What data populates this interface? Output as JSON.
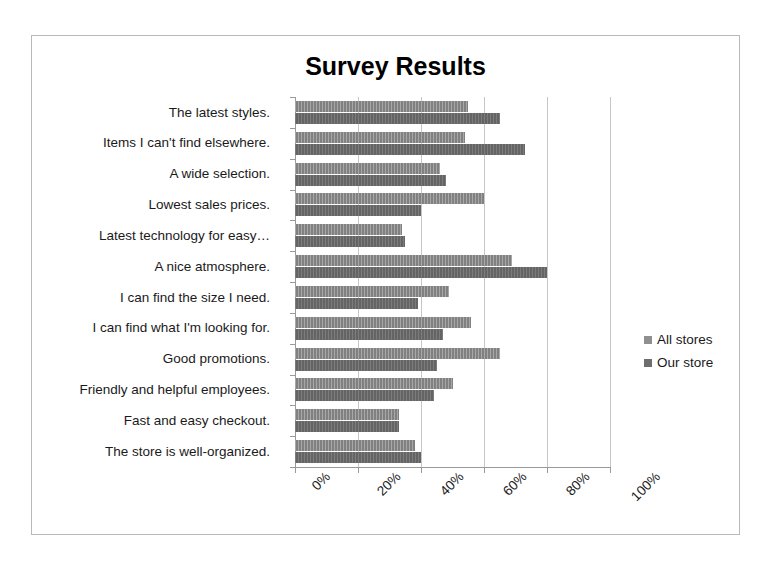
{
  "chart_data": {
    "type": "bar",
    "orientation": "horizontal",
    "title": "Survey Results",
    "xlabel": "",
    "ylabel": "",
    "xlim": [
      0,
      100
    ],
    "xticks": [
      "0%",
      "20%",
      "40%",
      "60%",
      "80%",
      "100%"
    ],
    "xtick_values": [
      0,
      20,
      40,
      60,
      80,
      100
    ],
    "grid": true,
    "legend_position": "right",
    "categories": [
      "The latest styles.",
      "Items I can't find elsewhere.",
      "A wide selection.",
      "Lowest sales prices.",
      "Latest technology for easy…",
      "A nice atmosphere.",
      "I can find the size I need.",
      "I can find what I'm looking for.",
      "Good promotions.",
      "Friendly and helpful employees.",
      "Fast and easy checkout.",
      "The store is well-organized."
    ],
    "series": [
      {
        "name": "All stores",
        "color": "#8f8f8f",
        "values": [
          55,
          54,
          46,
          60,
          34,
          69,
          49,
          56,
          65,
          50,
          33,
          38
        ]
      },
      {
        "name": "Our store",
        "color": "#6d6d6d",
        "values": [
          65,
          73,
          48,
          40,
          35,
          80,
          39,
          47,
          45,
          44,
          33,
          40
        ]
      }
    ]
  },
  "legend": {
    "entries": [
      {
        "label": "All stores"
      },
      {
        "label": "Our store"
      }
    ]
  }
}
